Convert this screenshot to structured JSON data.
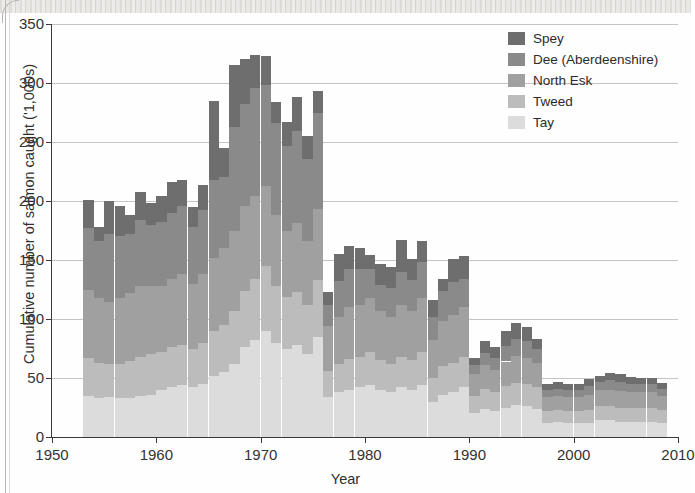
{
  "figure": {
    "xlabel": "Year",
    "ylabel": "Cumulative number of salmon caught ('1,000s)"
  },
  "legend": {
    "position": "top-right",
    "items": [
      {
        "label": "Spey",
        "color": "#6e6e6e"
      },
      {
        "label": "Dee (Aberdeenshire)",
        "color": "#8a8a8a"
      },
      {
        "label": "North Esk",
        "color": "#a0a0a0"
      },
      {
        "label": "Tweed",
        "color": "#bcbcbc"
      },
      {
        "label": "Tay",
        "color": "#dcdcdc"
      }
    ]
  },
  "axes": {
    "y_ticks": [
      "0",
      "50",
      "100",
      "150",
      "200",
      "250",
      "300",
      "350"
    ],
    "x_ticks": [
      "1950",
      "1960",
      "1970",
      "1980",
      "1990",
      "2000",
      "2010"
    ],
    "ylim": [
      0,
      350
    ],
    "xlim": [
      1950,
      2010
    ]
  },
  "chart_data": {
    "type": "bar",
    "stacked": true,
    "title": "",
    "xlabel": "Year",
    "ylabel": "Cumulative number of salmon caught ('1,000s)",
    "ylim": [
      0,
      350
    ],
    "xlim": [
      1950,
      2010
    ],
    "grid": "horizontal",
    "legend_position": "top-right",
    "categories": [
      1953,
      1954,
      1955,
      1956,
      1957,
      1958,
      1959,
      1960,
      1961,
      1962,
      1963,
      1964,
      1965,
      1966,
      1967,
      1968,
      1969,
      1970,
      1971,
      1972,
      1973,
      1974,
      1975,
      1976,
      1977,
      1978,
      1979,
      1980,
      1981,
      1982,
      1983,
      1984,
      1985,
      1986,
      1987,
      1988,
      1989,
      1990,
      1991,
      1992,
      1993,
      1994,
      1995,
      1996,
      1997,
      1998,
      1999,
      2000,
      2001,
      2002,
      2003,
      2004,
      2005,
      2006,
      2007,
      2008
    ],
    "series": [
      {
        "name": "Tay",
        "color": "#dcdcdc",
        "values": [
          35,
          33,
          34,
          33,
          33,
          35,
          36,
          40,
          42,
          44,
          42,
          45,
          52,
          55,
          62,
          76,
          82,
          90,
          80,
          75,
          78,
          70,
          85,
          34,
          38,
          40,
          42,
          44,
          40,
          38,
          42,
          40,
          44,
          30,
          36,
          38,
          42,
          20,
          24,
          22,
          25,
          27,
          26,
          24,
          12,
          13,
          12,
          12,
          12,
          14,
          14,
          13,
          13,
          13,
          13,
          12
        ]
      },
      {
        "name": "Tweed",
        "color": "#bcbcbc",
        "values": [
          32,
          30,
          28,
          29,
          31,
          33,
          34,
          32,
          34,
          34,
          33,
          35,
          38,
          40,
          45,
          48,
          52,
          55,
          48,
          44,
          45,
          42,
          48,
          22,
          24,
          26,
          26,
          28,
          25,
          24,
          26,
          25,
          28,
          20,
          24,
          25,
          26,
          15,
          17,
          16,
          18,
          19,
          19,
          18,
          10,
          10,
          10,
          10,
          11,
          12,
          12,
          12,
          12,
          12,
          12,
          11
        ]
      },
      {
        "name": "North Esk",
        "color": "#a0a0a0",
        "values": [
          58,
          55,
          52,
          56,
          58,
          60,
          58,
          56,
          58,
          60,
          55,
          58,
          62,
          65,
          68,
          72,
          70,
          68,
          60,
          56,
          58,
          54,
          60,
          38,
          40,
          44,
          44,
          46,
          42,
          40,
          44,
          42,
          46,
          32,
          38,
          40,
          42,
          18,
          20,
          19,
          21,
          23,
          22,
          21,
          12,
          12,
          12,
          12,
          13,
          14,
          14,
          14,
          13,
          13,
          13,
          12
        ]
      },
      {
        "name": "Dee (Aberdeenshire)",
        "color": "#8a8a8a",
        "values": [
          52,
          48,
          58,
          52,
          50,
          56,
          52,
          54,
          56,
          58,
          48,
          54,
          66,
          60,
          88,
          86,
          92,
          85,
          78,
          72,
          78,
          70,
          82,
          18,
          30,
          32,
          30,
          24,
          22,
          24,
          28,
          26,
          30,
          20,
          26,
          28,
          24,
          8,
          10,
          10,
          13,
          14,
          14,
          12,
          6,
          6,
          6,
          6,
          7,
          7,
          8,
          8,
          7,
          7,
          7,
          6
        ]
      },
      {
        "name": "Spey",
        "color": "#6e6e6e",
        "values": [
          24,
          12,
          28,
          26,
          16,
          24,
          18,
          22,
          26,
          22,
          17,
          22,
          67,
          25,
          52,
          38,
          28,
          25,
          18,
          20,
          29,
          19,
          18,
          11,
          23,
          20,
          18,
          12,
          18,
          18,
          27,
          18,
          18,
          14,
          10,
          20,
          19,
          6,
          10,
          9,
          13,
          14,
          12,
          8,
          5,
          6,
          5,
          5,
          6,
          5,
          6,
          6,
          6,
          5,
          5,
          5
        ]
      }
    ],
    "totals": [
      201,
      178,
      200,
      196,
      188,
      208,
      198,
      204,
      216,
      218,
      195,
      214,
      285,
      245,
      315,
      320,
      324,
      323,
      284,
      267,
      288,
      255,
      293,
      123,
      155,
      162,
      160,
      154,
      147,
      144,
      167,
      151,
      166,
      116,
      134,
      151,
      153,
      67,
      81,
      76,
      90,
      97,
      93,
      83,
      45,
      47,
      45,
      45,
      49,
      52,
      54,
      53,
      51,
      50,
      50,
      46
    ]
  }
}
